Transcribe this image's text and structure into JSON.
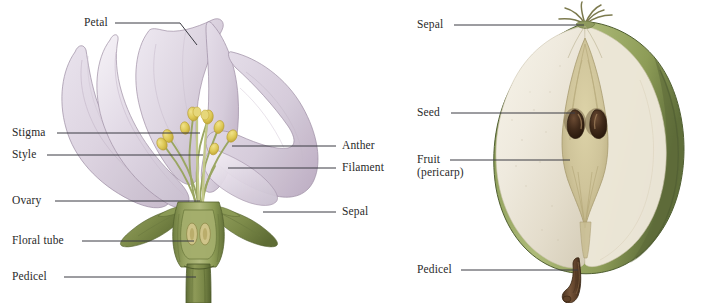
{
  "figure": {
    "kind": "botanical-illustration",
    "panels": [
      {
        "id": "flower",
        "subject": "flower-longitudinal-section",
        "labels": [
          {
            "key": "petal",
            "text": "Petal",
            "side": "left"
          },
          {
            "key": "stigma",
            "text": "Stigma",
            "side": "left"
          },
          {
            "key": "style",
            "text": "Style",
            "side": "left"
          },
          {
            "key": "ovary",
            "text": "Ovary",
            "side": "left"
          },
          {
            "key": "floral_tube",
            "text": "Floral tube",
            "side": "left"
          },
          {
            "key": "pedicel",
            "text": "Pedicel",
            "side": "left"
          },
          {
            "key": "anther",
            "text": "Anther",
            "side": "right"
          },
          {
            "key": "filament",
            "text": "Filament",
            "side": "right"
          },
          {
            "key": "sepal",
            "text": "Sepal",
            "side": "right"
          }
        ]
      },
      {
        "id": "fruit",
        "subject": "pear-longitudinal-section",
        "labels": [
          {
            "key": "sepal",
            "text": "Sepal",
            "side": "left"
          },
          {
            "key": "seed",
            "text": "Seed",
            "side": "left"
          },
          {
            "key": "fruit",
            "text": "Fruit",
            "side": "left"
          },
          {
            "key": "fruit2",
            "text": "(pericarp)",
            "side": "left"
          },
          {
            "key": "pedicel",
            "text": "Pedicel",
            "side": "left"
          }
        ]
      }
    ]
  },
  "colors": {
    "background": "#ffffff",
    "leader_line": "#3a3a42",
    "label_text": "#2a2a2a",
    "petal_light": "#ece6ef",
    "petal_mid": "#d9cfdd",
    "petal_shadow": "#c3b4c8",
    "petal_edge": "#8e7d95",
    "anther_yellow": "#e2cf5e",
    "anther_deep": "#c9ae38",
    "filament_green": "#b9bf7c",
    "stem_green": "#7b8a4a",
    "stem_dark": "#5d6c36",
    "stem_light": "#a7b272",
    "ovary_wall": "#8c9a57",
    "ovule_tan": "#c8bd7c",
    "pear_rind": "#7e8f4e",
    "pear_rind_light": "#aab873",
    "pear_flesh": "#f0ece0",
    "pear_flesh_shadow": "#ded8c6",
    "pear_core": "#d4caa0",
    "pear_core_dark": "#b7ab7c",
    "seed_brown": "#3b2418",
    "seed_highlight": "#8a6a4e",
    "pedicel_brown": "#6b4a2f",
    "pedicel_dark": "#4a3220"
  }
}
